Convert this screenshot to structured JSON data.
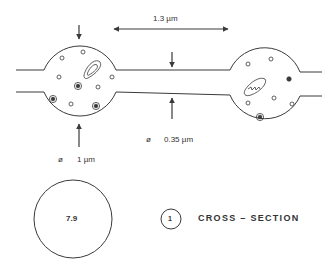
{
  "figure": {
    "colors": {
      "ink": "#3a3a3a",
      "background": "#ffffff"
    },
    "dimensions": {
      "spacing_label": "1.3 µm",
      "neck_diameter_symbol": "ø",
      "neck_diameter_value": "0.35 µm",
      "bulb_diameter_symbol": "ø",
      "bulb_diameter_value": "1 µm"
    },
    "cross_section": {
      "value": "7.9",
      "index": "1",
      "label": "CROSS – SECTION"
    },
    "icons": {
      "bulb_left": "varicosity-icon",
      "bulb_right": "varicosity-icon",
      "mitochondrion": "mitochondrion-icon",
      "vesicle": "vesicle-icon",
      "dense_core_vesicle": "dense-core-vesicle-icon"
    }
  }
}
